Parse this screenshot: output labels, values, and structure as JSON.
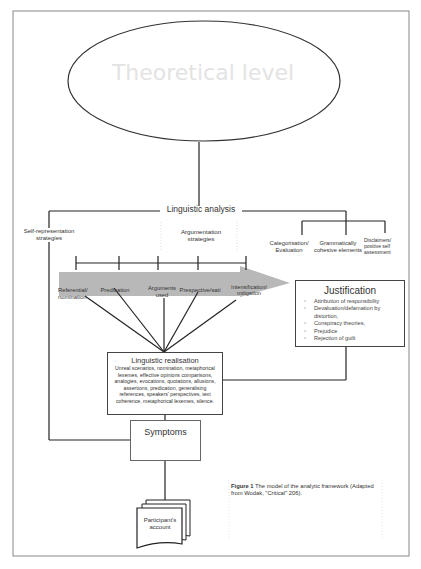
{
  "figure": {
    "theoretical_level": "Theoretical level",
    "linguistic_analysis": "Linguistic analysis",
    "self_representation": "Self-representation strategies",
    "argumentation": "Argumentation strategies",
    "right_branches": [
      "Categorisation/ Evaluation",
      "Grammatically cohesive elements",
      "Disclaimers/ positive self assessment"
    ],
    "arrow_stages": [
      "Referential/ nomination",
      "Predication",
      "Arguments used",
      "Prespective/sati",
      "Intensification/ mitigation"
    ],
    "justification": {
      "title": "Justification",
      "items": [
        "Attribution of responsibility",
        "Devaluation/defamation by distortion,",
        "Conspiracy theories,",
        "Prejudice",
        "Rejection of guilt"
      ]
    },
    "realisation": {
      "title": "Linguistic realisation",
      "body": "Unreal scenarios, nomination, metaphorical lexemes, effective opinions comparisons, analogies, evocations, quotations, allusions, assertions, predication, generalising references, speakers' perspectives, text coherence, metaphorical lexemes, silence."
    },
    "symptoms": "Symptoms",
    "document": "Participant's account",
    "caption": {
      "label": "Figure 1",
      "text": " The model of the analytic framework (Adapted from Wodak, \"Critical\" 206)."
    }
  }
}
